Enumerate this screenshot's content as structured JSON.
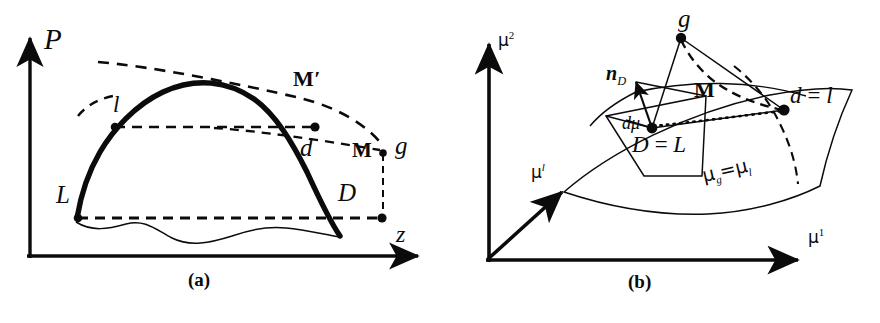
{
  "figure": {
    "background": "#ffffff",
    "ink": "#0b0b0b",
    "panels": [
      {
        "id": "a",
        "caption": "(a)"
      },
      {
        "id": "b",
        "caption": "(b)"
      }
    ]
  },
  "panel_a": {
    "caption": "(a)",
    "axes": {
      "y_label": "P",
      "x_label": "z"
    },
    "points": [
      {
        "name": "L",
        "label": "L"
      },
      {
        "name": "l",
        "label": "l"
      },
      {
        "name": "d",
        "label": "d"
      },
      {
        "name": "D",
        "label": "D"
      },
      {
        "name": "g",
        "label": "g"
      }
    ],
    "annotations": [
      {
        "name": "M-prime",
        "label": "M′"
      },
      {
        "name": "M",
        "label": "M"
      }
    ],
    "curves": [
      {
        "name": "binodal-dome",
        "style": "thick-solid"
      },
      {
        "name": "upper-dashed-branch",
        "style": "dashed"
      },
      {
        "name": "tie-line-l-d",
        "style": "dashed-horizontal"
      },
      {
        "name": "tie-line-L-D",
        "style": "dashed-horizontal"
      },
      {
        "name": "g-to-D-vertical",
        "style": "dashed-vertical"
      },
      {
        "name": "lower-wavy-curve",
        "style": "thin-solid"
      }
    ]
  },
  "panel_b": {
    "caption": "(b)",
    "axes": {
      "y_label_base": "μ",
      "y_label_sup": "2",
      "x_label_base": "μ",
      "x_label_sup": "1",
      "z_label_base": "μ",
      "z_label_sup": "l"
    },
    "points": [
      {
        "name": "g",
        "label": "g"
      },
      {
        "name": "D-equals-L",
        "label": "D = L"
      },
      {
        "name": "d-equals-l",
        "label": "d = l"
      }
    ],
    "annotations": [
      {
        "name": "normal-vector",
        "label_base": "n",
        "label_sub": "D"
      },
      {
        "name": "d-mu-vector",
        "label": "dμ"
      },
      {
        "name": "M-vector",
        "label": "M"
      },
      {
        "name": "surface-condition",
        "label_base": "μ",
        "label_sub_1": "g",
        "label_eq": "=",
        "label_base_2": "μ",
        "label_sub_2": "l"
      }
    ],
    "elements": [
      {
        "name": "equilibrium-surface",
        "style": "thin-solid-curved-patch"
      },
      {
        "name": "tangent-plane",
        "style": "thin-solid-quadrilateral"
      },
      {
        "name": "normal-arrow",
        "style": "solid-arrow"
      },
      {
        "name": "dotted-chord",
        "style": "dotted"
      },
      {
        "name": "dashed-geodesic",
        "style": "dashed"
      },
      {
        "name": "solid-triangle-links",
        "style": "thin-solid"
      }
    ]
  }
}
